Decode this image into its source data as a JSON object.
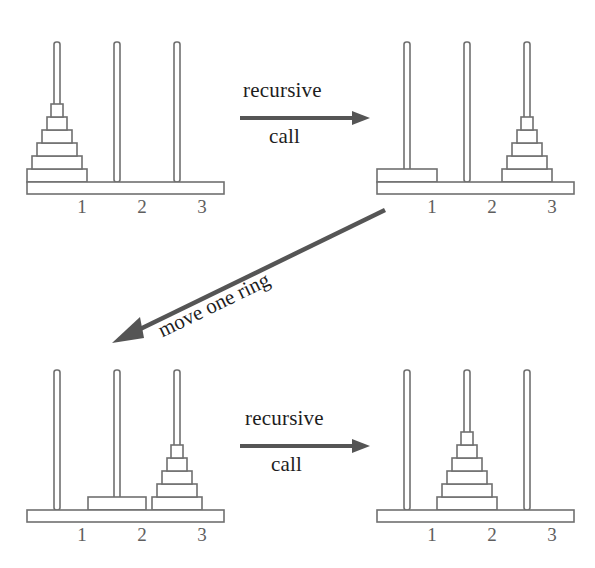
{
  "figure": {
    "background_color": "#ffffff",
    "stroke_color": "#707070",
    "fill_color": "#ffffff",
    "arrow_color": "#555555",
    "label_color": "#1d1d1d",
    "peg_number_color": "#5e5e5e",
    "total_rings": 6
  },
  "panels": [
    {
      "id": "panel-initial",
      "position": "top-left",
      "pegs": [
        {
          "label": "1",
          "rings": [
            6,
            5,
            4,
            3,
            2,
            1
          ]
        },
        {
          "label": "2",
          "rings": []
        },
        {
          "label": "3",
          "rings": []
        }
      ]
    },
    {
      "id": "panel-after-first-recursive-call",
      "position": "top-right",
      "pegs": [
        {
          "label": "1",
          "rings": [
            6
          ]
        },
        {
          "label": "2",
          "rings": []
        },
        {
          "label": "3",
          "rings": [
            5,
            4,
            3,
            2,
            1
          ]
        }
      ]
    },
    {
      "id": "panel-after-move-one-ring",
      "position": "bottom-left",
      "pegs": [
        {
          "label": "1",
          "rings": []
        },
        {
          "label": "2",
          "rings": [
            6
          ]
        },
        {
          "label": "3",
          "rings": [
            5,
            4,
            3,
            2,
            1
          ]
        }
      ]
    },
    {
      "id": "panel-final",
      "position": "bottom-right",
      "pegs": [
        {
          "label": "1",
          "rings": []
        },
        {
          "label": "2",
          "rings": [
            6,
            5,
            4,
            3,
            2,
            1
          ]
        },
        {
          "label": "3",
          "rings": []
        }
      ]
    }
  ],
  "arrows": [
    {
      "id": "arrow-top",
      "direction": "right",
      "label_line1": "recursive",
      "label_line2": "call"
    },
    {
      "id": "arrow-diagonal",
      "direction": "down-left",
      "label": "move one ring"
    },
    {
      "id": "arrow-bottom",
      "direction": "right",
      "label_line1": "recursive",
      "label_line2": "call"
    }
  ],
  "peg_numbers": [
    "1",
    "2",
    "3"
  ]
}
